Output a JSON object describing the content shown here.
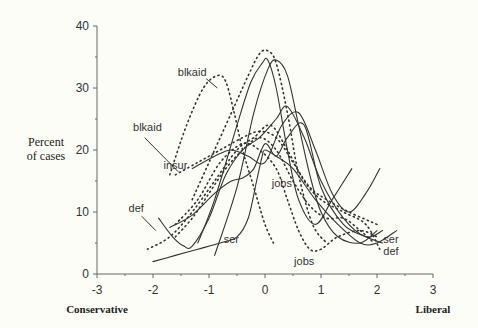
{
  "chart_data": {
    "type": "line",
    "title": "",
    "xlabel_left": "Conservative",
    "xlabel_right": "Liberal",
    "ylabel": [
      "Percent",
      "of cases"
    ],
    "xlim": [
      -3,
      3
    ],
    "ylim": [
      0,
      40
    ],
    "xticks": [
      -3,
      -2,
      -1,
      0,
      1,
      2,
      3
    ],
    "yticks": [
      0,
      10,
      20,
      30,
      40
    ],
    "grid": false,
    "legend": "none (curves labeled inline)",
    "series": [
      {
        "name": "blkaid (dotted, early)",
        "style": "dotted",
        "x": [
          -1.7,
          -1.4,
          -1.1,
          -0.85,
          -0.7,
          -0.55,
          -0.4,
          -0.2,
          0.0,
          0.15
        ],
        "y": [
          16,
          24,
          30,
          32,
          31,
          26,
          20,
          14,
          8,
          5
        ]
      },
      {
        "name": "blkaid (dotted, late)",
        "style": "dotted",
        "x": [
          -1.3,
          -1.0,
          -0.6,
          -0.3,
          -0.1,
          0.05,
          0.2,
          0.4,
          0.6,
          0.85,
          1.1
        ],
        "y": [
          12,
          18,
          26,
          32,
          35.5,
          36,
          34,
          26,
          16,
          8,
          5
        ]
      },
      {
        "name": "blkaid (solid A)",
        "style": "solid",
        "x": [
          -1.2,
          -0.9,
          -0.5,
          -0.25,
          -0.05,
          0.05,
          0.2,
          0.4,
          0.6,
          0.9,
          1.2,
          1.55
        ],
        "y": [
          5,
          12,
          24,
          31,
          34,
          34.5,
          30,
          20,
          12,
          8,
          12,
          17
        ]
      },
      {
        "name": "blkaid (solid B)",
        "style": "solid",
        "x": [
          -0.9,
          -0.5,
          -0.2,
          0.05,
          0.2,
          0.4,
          0.6,
          0.8,
          1.0,
          1.3,
          1.7,
          2.0
        ],
        "y": [
          3,
          14,
          26,
          33,
          34.5,
          32,
          24,
          16,
          10,
          6,
          5,
          7
        ]
      },
      {
        "name": "insur (dotted)",
        "style": "dotted",
        "x": [
          -1.6,
          -1.2,
          -0.8,
          -0.4,
          -0.1,
          0.2,
          0.5,
          0.8,
          1.1,
          1.5,
          2.0
        ],
        "y": [
          16,
          18,
          20,
          22,
          23,
          22,
          18,
          14,
          12,
          10,
          8
        ]
      },
      {
        "name": "insur (solid)",
        "style": "solid",
        "x": [
          -1.3,
          -0.9,
          -0.6,
          -0.3,
          0.0,
          0.3,
          0.6,
          0.9,
          1.2,
          1.5,
          1.8,
          2.05
        ],
        "y": [
          17,
          19,
          20,
          19,
          18,
          24,
          26,
          20,
          13,
          10,
          13,
          17
        ]
      },
      {
        "name": "def (solid)",
        "style": "solid",
        "x": [
          -1.9,
          -1.65,
          -1.45,
          -1.3,
          -1.0,
          -0.7,
          -0.4,
          -0.1,
          0.2,
          0.4,
          0.7,
          1.0,
          1.4,
          1.8,
          2.1
        ],
        "y": [
          9,
          6,
          4.5,
          4.5,
          9,
          16,
          20,
          22,
          25,
          27,
          22,
          15,
          9,
          6,
          7
        ]
      },
      {
        "name": "def (dotted)",
        "style": "dotted",
        "x": [
          -2.1,
          -1.7,
          -1.3,
          -0.9,
          -0.5,
          -0.2,
          0.1,
          0.4,
          0.7,
          1.0,
          1.4,
          1.8,
          2.05
        ],
        "y": [
          4,
          6,
          10,
          15,
          20,
          22,
          24,
          20,
          15,
          12,
          10,
          8,
          4
        ]
      },
      {
        "name": "jobs (solid)",
        "style": "solid",
        "x": [
          -1.7,
          -1.3,
          -0.9,
          -0.6,
          -0.4,
          -0.2,
          0.0,
          0.2,
          0.4,
          0.7,
          1.0,
          1.4,
          1.8,
          2.1
        ],
        "y": [
          7.5,
          9.5,
          13,
          15,
          15.5,
          17,
          21,
          19,
          22,
          24,
          14,
          8,
          6,
          5
        ]
      },
      {
        "name": "jobs (dotted)",
        "style": "dotted",
        "x": [
          -1.6,
          -1.2,
          -0.8,
          -0.4,
          -0.1,
          0.2,
          0.4,
          0.6,
          0.8,
          1.0,
          1.3,
          1.7,
          2.0
        ],
        "y": [
          8,
          12,
          18,
          21,
          20,
          17,
          12,
          7,
          4,
          4,
          6,
          7,
          6
        ]
      },
      {
        "name": "ser (solid)",
        "style": "solid",
        "x": [
          -2.0,
          -1.6,
          -1.2,
          -0.8,
          -0.5,
          -0.3,
          -0.15,
          -0.05,
          0.0,
          0.2,
          0.5,
          0.9,
          1.3,
          1.7,
          2.0,
          2.35
        ],
        "y": [
          2,
          3,
          4,
          5,
          6,
          9,
          15,
          19,
          20,
          19,
          17,
          12,
          8,
          5,
          5,
          7
        ]
      },
      {
        "name": "ser (dotted)",
        "style": "dotted",
        "x": [
          -1.6,
          -1.3,
          -1.0,
          -0.7,
          -0.4,
          -0.1,
          0.2,
          0.5,
          0.8,
          1.1,
          1.4,
          1.7,
          1.95
        ],
        "y": [
          6,
          9,
          13,
          17,
          20,
          22,
          20,
          15,
          11,
          9,
          9,
          7,
          5
        ]
      }
    ],
    "annotations": [
      {
        "text": "blkaid",
        "x": -1.3,
        "y": 32
      },
      {
        "text": "blkaid",
        "x": -2.1,
        "y": 23
      },
      {
        "text": "insur",
        "x": -1.6,
        "y": 17
      },
      {
        "text": "def",
        "x": -2.3,
        "y": 10
      },
      {
        "text": "jobs",
        "x": 0.3,
        "y": 14
      },
      {
        "text": "ser",
        "x": -0.6,
        "y": 5
      },
      {
        "text": "jobs",
        "x": 0.7,
        "y": 1.5
      },
      {
        "text": "ser",
        "x": 2.25,
        "y": 5
      },
      {
        "text": "def",
        "x": 2.25,
        "y": 3
      }
    ]
  }
}
